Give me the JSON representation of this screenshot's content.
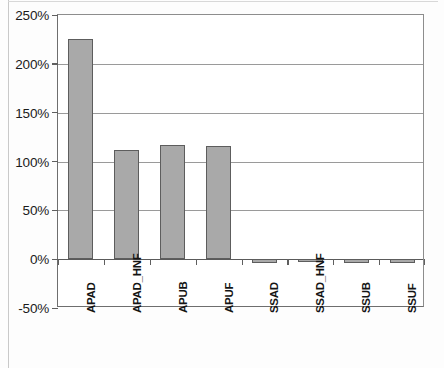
{
  "chart_data": {
    "type": "bar",
    "title": "",
    "xlabel": "",
    "ylabel": "",
    "categories": [
      "APAD",
      "APAD_HNF",
      "APUB",
      "APUF",
      "SSAD",
      "SSAD_HNF",
      "SSUB",
      "SSUF"
    ],
    "values": [
      225,
      112,
      117,
      116,
      -4,
      -3,
      -4,
      -4
    ],
    "value_labels": [
      "225%",
      "112%",
      "117%",
      "116%",
      "-4%",
      "-3%",
      "-4%",
      "-4%"
    ],
    "ylim": [
      -50,
      250
    ],
    "ytick_values": [
      250,
      200,
      150,
      100,
      50,
      0,
      -50
    ],
    "ytick_labels": [
      "250%",
      "200%",
      "150%",
      "100%",
      "50%",
      "0%",
      "-50%"
    ],
    "grid": true,
    "grid_axis": "y",
    "legend": null,
    "legend_position": "none",
    "series": [
      {
        "name": "",
        "values": [
          225,
          112,
          117,
          116,
          -4,
          -3,
          -4,
          -4
        ],
        "color": "#a9a9a9",
        "edge_color": "#5d5d5d"
      }
    ],
    "colors": {
      "bar_fill": "#a9a9a9",
      "bar_edge": "#5d5d5d",
      "gridline": "#9a9a9a",
      "axis": "#5f5f5f",
      "text": "#141414",
      "background": "#ffffff"
    }
  }
}
